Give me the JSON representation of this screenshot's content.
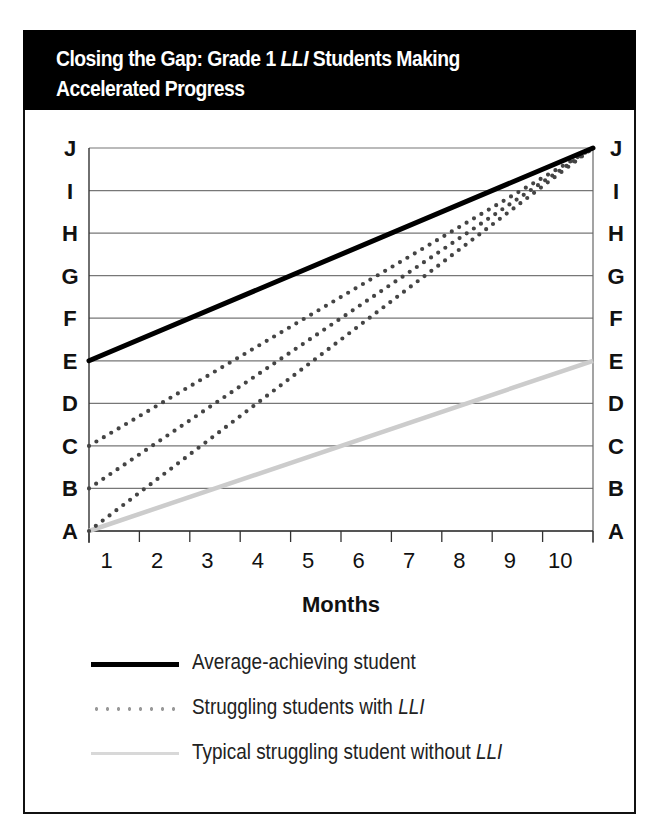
{
  "header": {
    "title_part1": "Closing the Gap: Grade 1 ",
    "title_italic": "LLI",
    "title_part2": " Students Making",
    "title_line2": "Accelerated Progress"
  },
  "chart_data": {
    "type": "line",
    "title": "Closing the Gap: Grade 1 LLI Students Making Accelerated Progress",
    "xlabel": "Months",
    "ylabel": "",
    "x": [
      1,
      2,
      3,
      4,
      5,
      6,
      7,
      8,
      9,
      10
    ],
    "x_tick_labels": [
      "1",
      "2",
      "3",
      "4",
      "5",
      "6",
      "7",
      "8",
      "9",
      "10"
    ],
    "y_levels": [
      "A",
      "B",
      "C",
      "D",
      "E",
      "F",
      "G",
      "H",
      "I",
      "J"
    ],
    "y_tick_labels_left": [
      "A",
      "B",
      "C",
      "D",
      "E",
      "F",
      "G",
      "H",
      "I",
      "J"
    ],
    "y_tick_labels_right": [
      "A",
      "B",
      "C",
      "D",
      "E",
      "F",
      "G",
      "H",
      "I",
      "J"
    ],
    "grid": true,
    "legend_position": "bottom",
    "series": [
      {
        "name": "Average-achieving student",
        "style": "solid-black",
        "color": "#000000",
        "start": "E",
        "end": "J",
        "start_index": 4,
        "end_index": 9
      },
      {
        "name": "Struggling students with LLI (starting at C)",
        "style": "dotted",
        "color": "#444444",
        "start": "C",
        "end": "J",
        "start_index": 2,
        "end_index": 9
      },
      {
        "name": "Struggling students with LLI (starting at B)",
        "style": "dotted",
        "color": "#444444",
        "start": "B",
        "end": "J",
        "start_index": 1,
        "end_index": 9
      },
      {
        "name": "Struggling students with LLI (starting at A)",
        "style": "dotted",
        "color": "#444444",
        "start": "A",
        "end": "J",
        "start_index": 0,
        "end_index": 9
      },
      {
        "name": "Typical struggling student without LLI",
        "style": "solid-light-gray",
        "color": "#cccccc",
        "start": "A",
        "end": "E",
        "start_index": 0,
        "end_index": 4
      }
    ]
  },
  "legend": [
    {
      "label_main": "Average-achieving student",
      "label_italic": "",
      "swatch": "solid-black"
    },
    {
      "label_main": "Struggling students with ",
      "label_italic": "LLI",
      "swatch": "dotted-gray"
    },
    {
      "label_main": "Typical struggling student without ",
      "label_italic": "LLI",
      "swatch": "solid-light-gray"
    }
  ]
}
